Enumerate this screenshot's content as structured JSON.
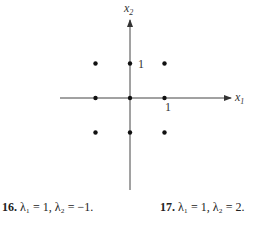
{
  "diagram": {
    "axes": {
      "x_label": "x",
      "x_sub": "1",
      "y_label": "x",
      "y_sub": "2"
    },
    "tick_labels": {
      "x_tick": "1",
      "y_tick": "1"
    },
    "lattice_points": [
      [
        -1,
        1
      ],
      [
        0,
        1
      ],
      [
        1,
        1
      ],
      [
        -1,
        0
      ],
      [
        0,
        0
      ],
      [
        1,
        0
      ],
      [
        -1,
        -1
      ],
      [
        0,
        -1
      ],
      [
        1,
        -1
      ]
    ]
  },
  "exercises": [
    {
      "number": "16.",
      "text": "λ₁ = 1, λ₂ = −1."
    },
    {
      "number": "17.",
      "text": "λ₁ = 1, λ₂ = 2."
    }
  ]
}
